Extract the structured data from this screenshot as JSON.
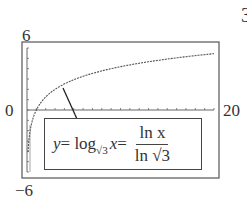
{
  "chart_data": {
    "type": "line",
    "title": "",
    "function": "y = log_sqrt3(x) = ln x / ln sqrt3",
    "xlabel": "",
    "ylabel": "",
    "xlim": [
      0,
      20
    ],
    "ylim": [
      -6,
      6
    ],
    "x_ticks_every": 1,
    "y_ticks_every": 1,
    "grid": false,
    "legend": "none",
    "x": [
      0.1,
      0.25,
      0.5,
      1,
      2,
      3,
      4,
      5,
      6,
      8,
      10,
      12,
      14,
      16,
      18,
      20
    ],
    "values": [
      -4.19,
      -2.52,
      -1.26,
      0,
      1.26,
      2,
      2.52,
      2.93,
      3.26,
      3.79,
      4.19,
      4.52,
      4.8,
      5.05,
      5.26,
      5.45
    ],
    "annotation": "y = log√3 x = ln x / ln √3"
  },
  "labels": {
    "ymax": "6",
    "ymin": "−6",
    "xmin": "0",
    "xmax": "20",
    "corner": "3"
  },
  "formula": {
    "lhs_var": "y",
    "eq1": " = log",
    "base": "√3",
    "arg": "x",
    "eq2": " = ",
    "numerator": "ln x",
    "denominator": "ln √3"
  }
}
